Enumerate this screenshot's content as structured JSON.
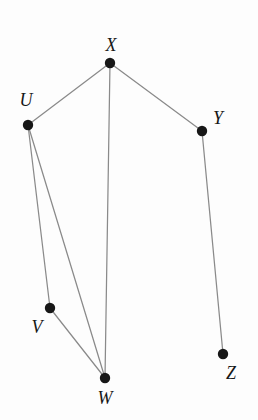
{
  "diagram": {
    "type": "node-link-graph",
    "width": 258,
    "height": 420,
    "background_color": "#fdfdfd",
    "edge_color": "#8a8a8a",
    "node_color": "#171717",
    "label_color": "#171717",
    "node_radius": 5.2,
    "edge_width": 1.25
  },
  "nodes": [
    {
      "id": "U",
      "label": "U",
      "x": 28,
      "y": 125,
      "label_x": 26,
      "label_y": 100
    },
    {
      "id": "V",
      "label": "V",
      "x": 50,
      "y": 308,
      "label_x": 37,
      "label_y": 327
    },
    {
      "id": "W",
      "label": "W",
      "x": 105,
      "y": 378,
      "label_x": 105,
      "label_y": 398
    },
    {
      "id": "X",
      "label": "X",
      "x": 110,
      "y": 63,
      "label_x": 111,
      "label_y": 45
    },
    {
      "id": "Y",
      "label": "Y",
      "x": 202,
      "y": 131,
      "label_x": 218,
      "label_y": 118
    },
    {
      "id": "Z",
      "label": "Z",
      "x": 223,
      "y": 354,
      "label_x": 231,
      "label_y": 373
    }
  ],
  "edges": [
    {
      "id": "edge-x-u",
      "from": "X",
      "to": "U",
      "x1": 110,
      "y1": 63,
      "x2": 28,
      "y2": 125
    },
    {
      "id": "edge-x-y",
      "from": "X",
      "to": "Y",
      "x1": 110,
      "y1": 63,
      "x2": 202,
      "y2": 131
    },
    {
      "id": "edge-x-w",
      "from": "X",
      "to": "W",
      "x1": 110,
      "y1": 63,
      "x2": 105,
      "y2": 378
    },
    {
      "id": "edge-u-v",
      "from": "U",
      "to": "V",
      "x1": 28,
      "y1": 125,
      "x2": 50,
      "y2": 308
    },
    {
      "id": "edge-u-w",
      "from": "U",
      "to": "W",
      "x1": 28,
      "y1": 125,
      "x2": 105,
      "y2": 378
    },
    {
      "id": "edge-v-w",
      "from": "V",
      "to": "W",
      "x1": 50,
      "y1": 308,
      "x2": 105,
      "y2": 378
    },
    {
      "id": "edge-y-z",
      "from": "Y",
      "to": "Z",
      "x1": 202,
      "y1": 131,
      "x2": 223,
      "y2": 354
    }
  ]
}
